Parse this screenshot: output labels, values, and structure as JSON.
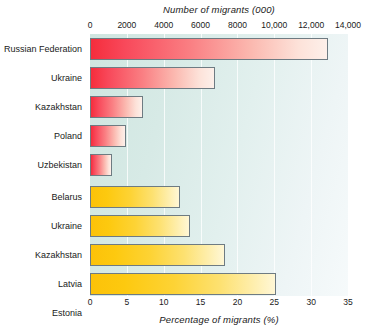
{
  "chart_data": {
    "type": "bar",
    "orientation": "horizontal",
    "title": "",
    "grid": true,
    "legend": "none",
    "panels": [
      {
        "id": "migrants-absolute",
        "axis_position": "top",
        "xlabel": "Number of migrants (000)",
        "xlim": [
          0,
          14000
        ],
        "ticks": [
          0,
          2000,
          4000,
          6000,
          8000,
          10000,
          12000,
          14000
        ],
        "tick_labels": [
          "0",
          "2000",
          "4000",
          "6000",
          "8000",
          "10,000",
          "12,000",
          "14,000"
        ],
        "color": "#f52d3c",
        "categories": [
          "Russian Federation",
          "Ukraine",
          "Kazakhstan",
          "Poland",
          "Uzbekistan"
        ],
        "values": [
          12900,
          6800,
          2900,
          1950,
          1200
        ]
      },
      {
        "id": "migrants-percentage",
        "axis_position": "bottom",
        "xlabel": "Percentage of migrants (%)",
        "xlim": [
          0,
          35
        ],
        "ticks": [
          0,
          5,
          10,
          15,
          20,
          25,
          30,
          35
        ],
        "tick_labels": [
          "0",
          "5",
          "10",
          "15",
          "20",
          "25",
          "30",
          "35"
        ],
        "color": "#fcc209",
        "categories": [
          "Belarus",
          "Ukraine",
          "Kazakhstan",
          "Latvia",
          "Estonia"
        ],
        "values": [
          12.2,
          13.6,
          18.3,
          25.2,
          26.0
        ]
      }
    ],
    "colors": {
      "bar_red_start": "#f52d3c",
      "bar_red_end": "#fdf0ea",
      "bar_yellow_start": "#fcc209",
      "bar_yellow_end": "#fff7d6",
      "bar_border": "#6e7b82",
      "plot_background_left": "#cfe6e0",
      "plot_background_right": "#f6fafb",
      "gridline": "#ffffff",
      "text": "#1a1a1a"
    }
  }
}
